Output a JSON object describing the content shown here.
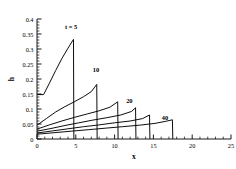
{
  "chart_data": {
    "type": "line",
    "title": "",
    "subtitle": "",
    "xlabel": "x",
    "ylabel": "h",
    "xlim": [
      0,
      25
    ],
    "ylim": [
      0,
      0.4
    ],
    "xticks": [
      0,
      5,
      10,
      15,
      20,
      25
    ],
    "xtick_labels": [
      "0",
      "5",
      "10",
      "15",
      "20",
      "25"
    ],
    "yticks": [
      0,
      0.05,
      0.1,
      0.15,
      0.2,
      0.25,
      0.3,
      0.35,
      0.4
    ],
    "ytick_labels": [
      "0",
      "0.05",
      "0.1",
      "0.15",
      "0.2",
      "0.25",
      "0.3",
      "0.35",
      "0.4"
    ],
    "x_minor_tick_count": 5,
    "y_minor_tick_count": 5,
    "grid": false,
    "legend": "none",
    "line_color": "#000000",
    "axis_color": "#000000",
    "background": "#ffffff",
    "annotations": [
      {
        "text": "t = 5",
        "x": 4.4,
        "y": 0.368
      },
      {
        "text": "10",
        "x": 7.6,
        "y": 0.222
      },
      {
        "text": "20",
        "x": 11.9,
        "y": 0.12
      },
      {
        "text": "40",
        "x": 16.5,
        "y": 0.062
      }
    ],
    "series": [
      {
        "name": "t = 5",
        "label": "t = 5",
        "points": [
          [
            0.0,
            0.148
          ],
          [
            0.85,
            0.148
          ],
          [
            1.6,
            0.186
          ],
          [
            2.4,
            0.228
          ],
          [
            3.2,
            0.268
          ],
          [
            4.0,
            0.303
          ],
          [
            4.7,
            0.332
          ],
          [
            4.75,
            0.0
          ]
        ]
      },
      {
        "name": "t = 10",
        "label": "10",
        "points": [
          [
            0.0,
            0.046
          ],
          [
            1.2,
            0.068
          ],
          [
            2.4,
            0.09
          ],
          [
            3.6,
            0.108
          ],
          [
            4.8,
            0.124
          ],
          [
            6.0,
            0.141
          ],
          [
            7.0,
            0.158
          ],
          [
            7.7,
            0.182
          ],
          [
            7.75,
            0.0
          ]
        ]
      },
      {
        "name": "t = 15",
        "label": "",
        "points": [
          [
            0.0,
            0.033
          ],
          [
            1.6,
            0.047
          ],
          [
            3.2,
            0.06
          ],
          [
            4.8,
            0.072
          ],
          [
            6.4,
            0.083
          ],
          [
            8.0,
            0.094
          ],
          [
            9.4,
            0.106
          ],
          [
            10.4,
            0.124
          ],
          [
            10.45,
            0.0
          ]
        ]
      },
      {
        "name": "t = 20",
        "label": "20",
        "points": [
          [
            0.0,
            0.026
          ],
          [
            1.8,
            0.035
          ],
          [
            3.6,
            0.045
          ],
          [
            5.4,
            0.054
          ],
          [
            7.2,
            0.063
          ],
          [
            9.0,
            0.071
          ],
          [
            10.8,
            0.08
          ],
          [
            12.2,
            0.092
          ],
          [
            12.7,
            0.104
          ],
          [
            12.75,
            0.0
          ]
        ]
      },
      {
        "name": "t = 28",
        "label": "",
        "points": [
          [
            0.0,
            0.02
          ],
          [
            2.0,
            0.027
          ],
          [
            4.0,
            0.034
          ],
          [
            6.0,
            0.041
          ],
          [
            8.0,
            0.047
          ],
          [
            10.0,
            0.054
          ],
          [
            12.0,
            0.06
          ],
          [
            13.6,
            0.068
          ],
          [
            14.5,
            0.08
          ],
          [
            14.55,
            0.0
          ]
        ]
      },
      {
        "name": "t = 40",
        "label": "40",
        "points": [
          [
            0.0,
            0.016
          ],
          [
            2.2,
            0.021
          ],
          [
            4.4,
            0.026
          ],
          [
            6.6,
            0.031
          ],
          [
            8.8,
            0.036
          ],
          [
            11.0,
            0.041
          ],
          [
            13.2,
            0.046
          ],
          [
            15.2,
            0.052
          ],
          [
            16.6,
            0.059
          ],
          [
            17.45,
            0.064
          ],
          [
            17.5,
            0.0
          ]
        ]
      }
    ]
  },
  "axes": {
    "ylabel": "h",
    "xlabel": "x"
  }
}
